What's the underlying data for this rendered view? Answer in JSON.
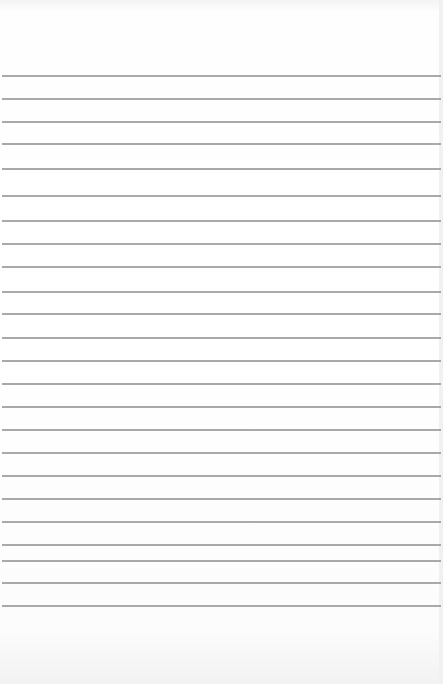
{
  "paper": {
    "line_color": "#9a9a9a",
    "line_positions_y": [
      75,
      98,
      121,
      143,
      168,
      195,
      220,
      243,
      266,
      291,
      313,
      337,
      360,
      383,
      406,
      429,
      452,
      475,
      498,
      521,
      544,
      560,
      582,
      605
    ]
  }
}
